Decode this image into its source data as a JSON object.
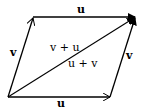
{
  "diagram": {
    "vectors": [
      {
        "id": "u_top",
        "label": "u",
        "from": [
          33,
          17
        ],
        "to": [
          136,
          17
        ]
      },
      {
        "id": "v_left",
        "label": "v",
        "from": [
          8,
          97
        ],
        "to": [
          33,
          17
        ]
      },
      {
        "id": "u_bottom",
        "label": "u",
        "from": [
          8,
          97
        ],
        "to": [
          110,
          97
        ]
      },
      {
        "id": "v_right",
        "label": "v",
        "from": [
          110,
          97
        ],
        "to": [
          136,
          17
        ]
      },
      {
        "id": "diagonal",
        "label": "sum",
        "from": [
          8,
          97
        ],
        "to": [
          136,
          17
        ]
      }
    ],
    "labels": {
      "u_top": "u",
      "v_left": "v",
      "v_right": "v",
      "u_bottom": "u",
      "v_plus_u": "v + u",
      "u_plus_v": "u + v"
    },
    "colors": {
      "stroke": "#000000",
      "background": "#ffffff"
    }
  }
}
